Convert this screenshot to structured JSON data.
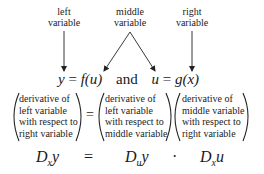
{
  "labels": {
    "left": [
      "left",
      "variable"
    ],
    "middle": [
      "middle",
      "variable"
    ],
    "right": [
      "right",
      "variable"
    ]
  },
  "equation_line": {
    "left_eq": {
      "lhs": "y",
      "eq": "=",
      "func": "f",
      "arg": "(u)"
    },
    "connector": "and",
    "right_eq": {
      "lhs": "u",
      "eq": "=",
      "func": "g",
      "arg": "(x)"
    }
  },
  "verbal_rule": {
    "term1": [
      "derivative of",
      "left variable",
      "with respect to",
      "right variable"
    ],
    "equals": "=",
    "term2": [
      "derivative of",
      "left variable",
      "with respect to",
      "middle variable"
    ],
    "term3": [
      "derivative of",
      "middle variable",
      "with respect to",
      "right variable"
    ]
  },
  "symbolic_rule": {
    "lhs": {
      "D": "D",
      "sub": "x",
      "var": "y"
    },
    "equals": "=",
    "rhs1": {
      "D": "D",
      "sub": "u",
      "var": "y"
    },
    "times": "·",
    "rhs2": {
      "D": "D",
      "sub": "x",
      "var": "u"
    }
  }
}
